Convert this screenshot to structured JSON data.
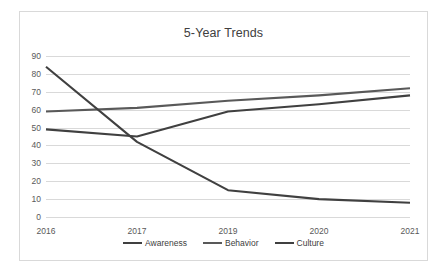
{
  "chart_data": {
    "type": "line",
    "title": "5-Year Trends",
    "xlabel": "",
    "ylabel": "",
    "categories": [
      "2016",
      "2017",
      "2019",
      "2020",
      "2021"
    ],
    "series": [
      {
        "name": "Awareness",
        "values": [
          49,
          45,
          59,
          63,
          68
        ],
        "color": "#404040"
      },
      {
        "name": "Behavior",
        "values": [
          59,
          61,
          65,
          68,
          72
        ],
        "color": "#595959"
      },
      {
        "name": "Culture",
        "values": [
          84,
          42,
          15,
          10,
          8
        ],
        "color": "#404040"
      }
    ],
    "ylim": [
      0,
      90
    ],
    "ytick_step": 10,
    "yticks": [
      "90",
      "80",
      "70",
      "60",
      "50",
      "40",
      "30",
      "20",
      "10",
      "0"
    ],
    "grid": true,
    "legend_position": "bottom",
    "plot_background": "#ffffff",
    "grid_color": "#d9d9d9",
    "border_color": "#d9d9d9",
    "tick_label_color": "#595959",
    "title_color": "#404040"
  }
}
